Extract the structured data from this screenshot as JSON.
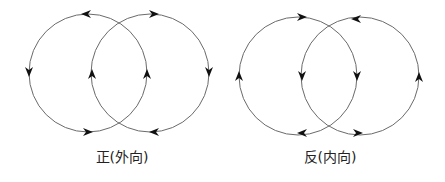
{
  "diagrams": [
    {
      "name": "positive-outward",
      "label": "正(外向)",
      "circles": [
        {
          "cx": 88,
          "cy": 73,
          "r": 59,
          "arrows": [
            "top:left",
            "left:down",
            "bottom:right",
            "right:up"
          ]
        },
        {
          "cx": 150,
          "cy": 73,
          "r": 59,
          "arrows": [
            "top:right",
            "right:down",
            "bottom:left",
            "left:up"
          ]
        }
      ]
    },
    {
      "name": "negative-inward",
      "label": "反(内向)",
      "circles": [
        {
          "cx": 298,
          "cy": 76,
          "r": 59,
          "arrows": [
            "top:right",
            "left:up",
            "bottom:left",
            "right:down"
          ]
        },
        {
          "cx": 360,
          "cy": 76,
          "r": 59,
          "arrows": [
            "top:left",
            "right:up",
            "bottom:right",
            "left:down"
          ]
        }
      ]
    }
  ],
  "colors": {
    "stroke": "#6a6a6a",
    "arrow": "#111111"
  }
}
